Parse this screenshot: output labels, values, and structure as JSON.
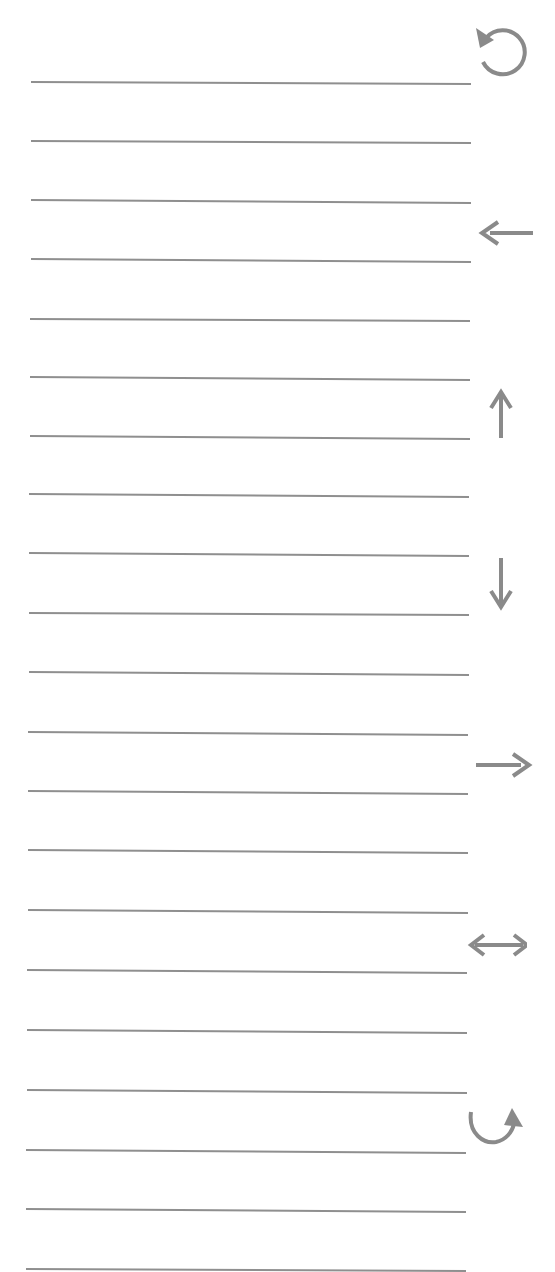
{
  "worksheet": {
    "line_color": "#8f8f8f",
    "icon_color": "#8a8a8a",
    "line_count": 21,
    "lines": [
      {
        "y_left": 81,
        "y_right": 83,
        "x_start": 31,
        "x_end": 471
      },
      {
        "y_left": 140,
        "y_right": 142,
        "x_start": 31,
        "x_end": 471
      },
      {
        "y_left": 199,
        "y_right": 202,
        "x_start": 31,
        "x_end": 471
      },
      {
        "y_left": 258,
        "y_right": 261,
        "x_start": 31,
        "x_end": 471
      },
      {
        "y_left": 318,
        "y_right": 320,
        "x_start": 30,
        "x_end": 470
      },
      {
        "y_left": 376,
        "y_right": 379,
        "x_start": 30,
        "x_end": 470
      },
      {
        "y_left": 435,
        "y_right": 438,
        "x_start": 30,
        "x_end": 470
      },
      {
        "y_left": 493,
        "y_right": 496,
        "x_start": 29,
        "x_end": 469
      },
      {
        "y_left": 552,
        "y_right": 555,
        "x_start": 29,
        "x_end": 469
      },
      {
        "y_left": 612,
        "y_right": 614,
        "x_start": 29,
        "x_end": 469
      },
      {
        "y_left": 671,
        "y_right": 674,
        "x_start": 29,
        "x_end": 469
      },
      {
        "y_left": 731,
        "y_right": 734,
        "x_start": 28,
        "x_end": 468
      },
      {
        "y_left": 790,
        "y_right": 793,
        "x_start": 28,
        "x_end": 468
      },
      {
        "y_left": 849,
        "y_right": 852,
        "x_start": 28,
        "x_end": 468
      },
      {
        "y_left": 909,
        "y_right": 912,
        "x_start": 28,
        "x_end": 468
      },
      {
        "y_left": 969,
        "y_right": 972,
        "x_start": 27,
        "x_end": 467
      },
      {
        "y_left": 1029,
        "y_right": 1032,
        "x_start": 27,
        "x_end": 467
      },
      {
        "y_left": 1089,
        "y_right": 1092,
        "x_start": 27,
        "x_end": 467
      },
      {
        "y_left": 1149,
        "y_right": 1152,
        "x_start": 26,
        "x_end": 466
      },
      {
        "y_left": 1208,
        "y_right": 1211,
        "x_start": 26,
        "x_end": 466
      },
      {
        "y_left": 1268,
        "y_right": 1270,
        "x_start": 26,
        "x_end": 466
      }
    ],
    "icons": [
      {
        "name": "rotate-counterclockwise-icon",
        "glyph": "counterclockwise-circular-arrow",
        "x": 470,
        "y": 20
      },
      {
        "name": "arrow-left-icon",
        "glyph": "left-arrow",
        "x": 476,
        "y": 202
      },
      {
        "name": "arrow-up-icon",
        "glyph": "up-arrow",
        "x": 474,
        "y": 383
      },
      {
        "name": "arrow-down-icon",
        "glyph": "down-arrow",
        "x": 471,
        "y": 553
      },
      {
        "name": "arrow-right-icon",
        "glyph": "right-arrow",
        "x": 473,
        "y": 735
      },
      {
        "name": "arrow-left-right-icon",
        "glyph": "left-right-arrow",
        "x": 467,
        "y": 916
      },
      {
        "name": "curved-arrow-up-right-icon",
        "glyph": "curved-arrow-up-right",
        "x": 466,
        "y": 1100
      }
    ]
  }
}
